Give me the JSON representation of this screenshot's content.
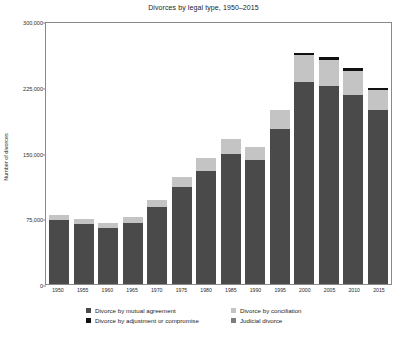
{
  "chart_data": {
    "type": "bar",
    "stacked": true,
    "title": "Divorces by legal type, 1950–2015",
    "xlabel": "",
    "ylabel": "Number of divorces",
    "ylim": [
      0,
      300000
    ],
    "yticks": [
      0,
      75000,
      150000,
      225000,
      300000
    ],
    "ytick_labels": [
      "0",
      "75,000",
      "150,000",
      "225,000",
      "300,000"
    ],
    "grid": false,
    "legend_position": "bottom",
    "categories": [
      "1950",
      "1955",
      "1960",
      "1965",
      "1970",
      "1975",
      "1980",
      "1985",
      "1990",
      "1995",
      "2000",
      "2005",
      "2010",
      "2015"
    ],
    "series": [
      {
        "name": "Divorce by mutual agreement",
        "color": "#4a4a4a",
        "values": [
          73000,
          68000,
          64000,
          70000,
          88000,
          111000,
          129000,
          148000,
          141000,
          177000,
          231000,
          226000,
          216000,
          199000
        ]
      },
      {
        "name": "Divorce by conciliation",
        "color": "#c4c4c4",
        "values": [
          6000,
          6000,
          6000,
          6000,
          8000,
          11000,
          15000,
          17000,
          15000,
          22000,
          30000,
          29000,
          27000,
          22000
        ]
      },
      {
        "name": "Divorce by adjustment or compromise",
        "color": "#111111",
        "values": [
          0,
          0,
          0,
          0,
          0,
          0,
          0,
          0,
          0,
          0,
          3000,
          4000,
          3000,
          3000
        ]
      },
      {
        "name": "Judicial divorce",
        "color": "#7d7d7d",
        "values": [
          0,
          0,
          0,
          0,
          0,
          0,
          0,
          0,
          0,
          0,
          0,
          0,
          0,
          0
        ]
      }
    ],
    "totals": [
      79000,
      74000,
      70000,
      76000,
      96000,
      122000,
      144000,
      165000,
      156000,
      199000,
      264000,
      259000,
      246000,
      224000
    ],
    "annotations": []
  },
  "legend": {
    "entries": [
      {
        "label": "Divorce by mutual agreement",
        "color": "#4a4a4a"
      },
      {
        "label": "Divorce by adjustment or compromise",
        "color": "#111111"
      },
      {
        "label": "Divorce by conciliation",
        "color": "#c4c4c4"
      },
      {
        "label": "Judicial divorce",
        "color": "#7d7d7d"
      }
    ]
  },
  "caption": ""
}
